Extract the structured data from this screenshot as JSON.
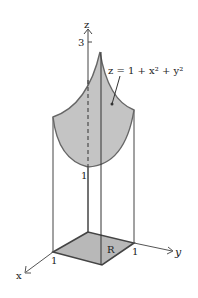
{
  "diagram": {
    "equation_label": "z = 1 + x² + y²",
    "axes": {
      "x_label": "x",
      "y_label": "y",
      "z_label": "z"
    },
    "ticks": {
      "z_top": "3",
      "z_bottom": "1",
      "x_one": "1",
      "y_one": "1"
    },
    "region_label": "R",
    "colors": {
      "surface_fill": "#c4c4c4",
      "region_fill": "#b8b8b8",
      "stroke": "#555555"
    }
  }
}
